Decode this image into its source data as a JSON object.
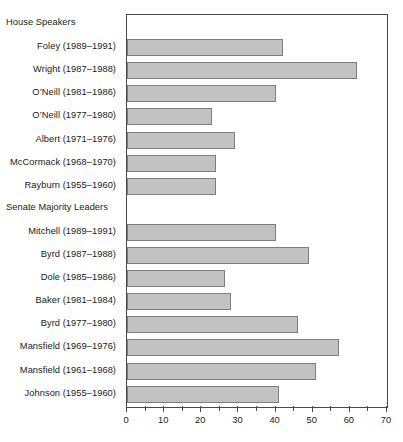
{
  "chart_data": {
    "type": "bar",
    "orientation": "horizontal",
    "title": "",
    "xlabel": "",
    "ylabel": "",
    "xlim": [
      0,
      70
    ],
    "xticks": [
      0,
      10,
      20,
      30,
      40,
      50,
      60,
      70
    ],
    "xtick_labels": [
      "0",
      "10",
      "20",
      "30",
      "40",
      "50",
      "60",
      "70"
    ],
    "minor_tick_step": 5,
    "grid": false,
    "legend": null,
    "bar_color": "#c2c2c2",
    "bar_edge_color": "#7d7d7d",
    "axis_color": "#4a4a4a",
    "groups": [
      {
        "header": "House Speakers",
        "categories": [
          "Foley (1989–1991)",
          "Wright (1987–1988)",
          "O’Neill (1981–1986)",
          "O’Neill (1977–1980)",
          "Albert (1971–1976)",
          "McCormack (1968–1970)",
          "Rayburn (1955–1960)"
        ],
        "values": [
          42,
          62,
          40,
          23,
          29,
          24,
          24
        ]
      },
      {
        "header": "Senate Majority Leaders",
        "categories": [
          "Mitchell (1989–1991)",
          "Byrd (1987–1988)",
          "Dole (1985–1986)",
          "Baker (1981–1984)",
          "Byrd (1977–1980)",
          "Mansfield (1969–1976)",
          "Mansfield (1961–1968)",
          "Johnson (1955–1960)"
        ],
        "values": [
          40,
          49,
          26.5,
          28,
          46,
          57,
          51,
          41
        ]
      }
    ]
  }
}
